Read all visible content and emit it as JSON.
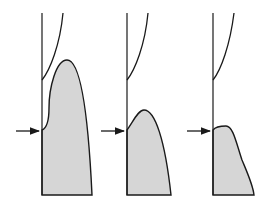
{
  "diagram": {
    "colors": {
      "line": "#1a1a1a",
      "fill": "#d6d6d6",
      "background": "#ffffff"
    },
    "panels": [
      {
        "id": "panel-1",
        "wall_x": 42,
        "arrow_y": 131,
        "upper_curve": "M42,80 C50,70 60,45 63,13",
        "shaded_profile": "M42,195 L42,130 C47,128 49,120 49,108 C49,88 56,60 67,60 C80,60 88,110 92,195 Z"
      },
      {
        "id": "panel-2",
        "wall_x": 127,
        "arrow_y": 131,
        "upper_curve": "M127,80 C135,70 145,45 148,13",
        "shaded_profile": "M127,195 L127,130 C133,122 138,110 144,110 C155,110 165,140 171,195 Z"
      },
      {
        "id": "panel-3",
        "wall_x": 213,
        "arrow_y": 131,
        "upper_curve": "M213,80 C221,70 230,45 234,13",
        "shaded_profile": "M213,195 L213,130 C216,126 222,126 226,126 C233,126 236,142 242,160 C247,172 253,185 254,195 Z"
      }
    ]
  }
}
